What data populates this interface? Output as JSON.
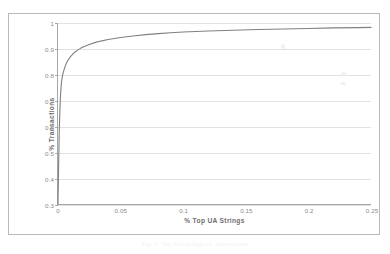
{
  "chart_data": {
    "type": "line",
    "title": "",
    "xlabel": "% Top UA Strings",
    "ylabel": "% Transactions",
    "xlim": [
      0,
      0.25
    ],
    "ylim": [
      0.3,
      1
    ],
    "grid": true,
    "legend": false,
    "x_ticks": [
      "0",
      "0.05",
      "0.1",
      "0.15",
      "0.2",
      "0.25"
    ],
    "x_tick_values": [
      0,
      0.05,
      0.1,
      0.15,
      0.2,
      0.25
    ],
    "y_ticks": [
      "0.3",
      "0.4",
      "0.5",
      "0.6",
      "0.7",
      "0.8",
      "0.9",
      "1"
    ],
    "y_tick_values": [
      0.3,
      0.4,
      0.5,
      0.6,
      0.7,
      0.8,
      0.9,
      1
    ],
    "series": [
      {
        "name": "cumulative transaction coverage",
        "color": "#808080",
        "x": [
          0,
          0.0005,
          0.001,
          0.0015,
          0.002,
          0.0025,
          0.003,
          0.004,
          0.005,
          0.006,
          0.007,
          0.008,
          0.01,
          0.012,
          0.014,
          0.016,
          0.018,
          0.02,
          0.025,
          0.03,
          0.035,
          0.04,
          0.05,
          0.06,
          0.07,
          0.08,
          0.09,
          0.1,
          0.12,
          0.14,
          0.16,
          0.18,
          0.2,
          0.22,
          0.24,
          0.25
        ],
        "y": [
          0.3,
          0.45,
          0.58,
          0.66,
          0.72,
          0.755,
          0.78,
          0.805,
          0.822,
          0.836,
          0.847,
          0.856,
          0.87,
          0.881,
          0.889,
          0.896,
          0.902,
          0.907,
          0.917,
          0.925,
          0.931,
          0.936,
          0.944,
          0.95,
          0.955,
          0.959,
          0.962,
          0.965,
          0.969,
          0.972,
          0.975,
          0.977,
          0.979,
          0.981,
          0.982,
          0.983
        ]
      }
    ]
  },
  "caption": {
    "text": "Fig. 1.  Top UA strings vs. transactions"
  }
}
